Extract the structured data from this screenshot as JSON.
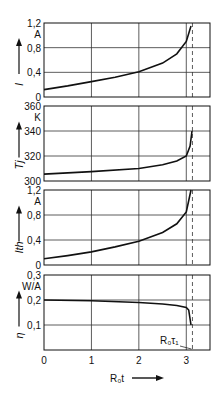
{
  "chart_data": [
    {
      "type": "line",
      "panel": 1,
      "ylabel": "I",
      "unit": "A",
      "ylim": [
        0,
        1.2
      ],
      "yticks": [
        "0",
        "0,4",
        "0,8",
        "1,2"
      ],
      "x": [
        0,
        0.5,
        1,
        1.5,
        2,
        2.5,
        2.8,
        3.0,
        3.1
      ],
      "values": [
        0.12,
        0.18,
        0.25,
        0.32,
        0.41,
        0.55,
        0.7,
        0.9,
        1.15
      ]
    },
    {
      "type": "line",
      "panel": 2,
      "ylabel": "T_j",
      "unit": "K",
      "ylim": [
        300,
        360
      ],
      "yticks": [
        "300",
        "320",
        "340",
        "360"
      ],
      "x": [
        0,
        1,
        2,
        2.5,
        2.8,
        3.0,
        3.08,
        3.12
      ],
      "values": [
        305.5,
        307.5,
        310,
        313,
        316,
        320,
        328,
        340
      ]
    },
    {
      "type": "line",
      "panel": 3,
      "ylabel": "I_th",
      "unit": "A",
      "ylim": [
        0,
        1.2
      ],
      "yticks": [
        "0",
        "0,4",
        "0,8",
        "1,2"
      ],
      "x": [
        0,
        0.5,
        1,
        1.5,
        2,
        2.5,
        2.8,
        3.0,
        3.1
      ],
      "values": [
        0.1,
        0.15,
        0.21,
        0.29,
        0.38,
        0.52,
        0.66,
        0.85,
        1.2
      ]
    },
    {
      "type": "line",
      "panel": 4,
      "ylabel": "η",
      "unit": "W/A",
      "ylim": [
        0,
        0.3
      ],
      "yticks": [
        "0,1",
        "0,2",
        "0,3"
      ],
      "x": [
        0,
        1,
        2,
        2.5,
        2.8,
        3.0,
        3.05,
        3.1
      ],
      "values": [
        0.2,
        0.197,
        0.19,
        0.184,
        0.178,
        0.17,
        0.16,
        0.1
      ],
      "annotation": "R₀τ₁"
    }
  ],
  "shared": {
    "xlabel": "R₀t",
    "xticks": [
      "0",
      "1",
      "2",
      "3"
    ],
    "xlim": [
      0,
      3.5
    ],
    "grid": true,
    "dashed_marker_x": 3.13
  }
}
